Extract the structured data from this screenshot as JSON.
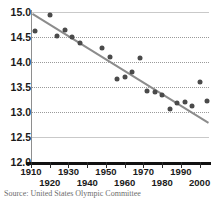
{
  "source_note": "Source: United States Olympic Committee",
  "chart_data": {
    "type": "scatter",
    "title": "",
    "xlabel": "",
    "ylabel": "",
    "xlim": [
      1910,
      2005
    ],
    "ylim": [
      12.0,
      15.0
    ],
    "grid": true,
    "legend": "none",
    "y_ticks": [
      "15.0",
      "14.5",
      "14.0",
      "13.5",
      "13.0",
      "12.5",
      "12.0"
    ],
    "y_tick_values": [
      15.0,
      14.5,
      14.0,
      13.5,
      13.0,
      12.5,
      12.0
    ],
    "x_ticks": [
      "1910",
      "1920",
      "1930",
      "1940",
      "1950",
      "1960",
      "1970",
      "1980",
      "1990",
      "2000"
    ],
    "x_tick_values": [
      1910,
      1920,
      1930,
      1940,
      1950,
      1960,
      1970,
      1980,
      1990,
      2000
    ],
    "x": [
      1912,
      1920,
      1924,
      1928,
      1932,
      1936,
      1948,
      1952,
      1956,
      1960,
      1964,
      1968,
      1972,
      1976,
      1980,
      1984,
      1988,
      1992,
      1996,
      2000,
      2004
    ],
    "y": [
      14.63,
      14.95,
      14.52,
      14.65,
      14.5,
      14.38,
      14.29,
      14.1,
      13.67,
      13.7,
      13.81,
      14.08,
      13.42,
      13.4,
      13.34,
      13.06,
      13.18,
      13.21,
      13.12,
      13.6,
      13.22
    ],
    "series": [
      {
        "name": "Winning time",
        "marker": "circle",
        "color": "#4a4a4a",
        "points": [
          {
            "x": 1912,
            "y": 14.63
          },
          {
            "x": 1920,
            "y": 14.95
          },
          {
            "x": 1924,
            "y": 14.52
          },
          {
            "x": 1928,
            "y": 14.65
          },
          {
            "x": 1932,
            "y": 14.5
          },
          {
            "x": 1936,
            "y": 14.38
          },
          {
            "x": 1948,
            "y": 14.29
          },
          {
            "x": 1952,
            "y": 14.1
          },
          {
            "x": 1956,
            "y": 13.67
          },
          {
            "x": 1960,
            "y": 13.7
          },
          {
            "x": 1964,
            "y": 13.81
          },
          {
            "x": 1968,
            "y": 14.08
          },
          {
            "x": 1972,
            "y": 13.42
          },
          {
            "x": 1976,
            "y": 13.4
          },
          {
            "x": 1980,
            "y": 13.34
          },
          {
            "x": 1984,
            "y": 13.06
          },
          {
            "x": 1988,
            "y": 13.18
          },
          {
            "x": 1992,
            "y": 13.21
          },
          {
            "x": 1996,
            "y": 13.12
          },
          {
            "x": 2000,
            "y": 13.6
          },
          {
            "x": 2004,
            "y": 13.22
          }
        ]
      },
      {
        "name": "Trend line",
        "type": "line",
        "color": "#8c8c8c",
        "endpoints": [
          {
            "x": 1911,
            "y": 14.97
          },
          {
            "x": 2005,
            "y": 12.79
          }
        ]
      }
    ]
  }
}
